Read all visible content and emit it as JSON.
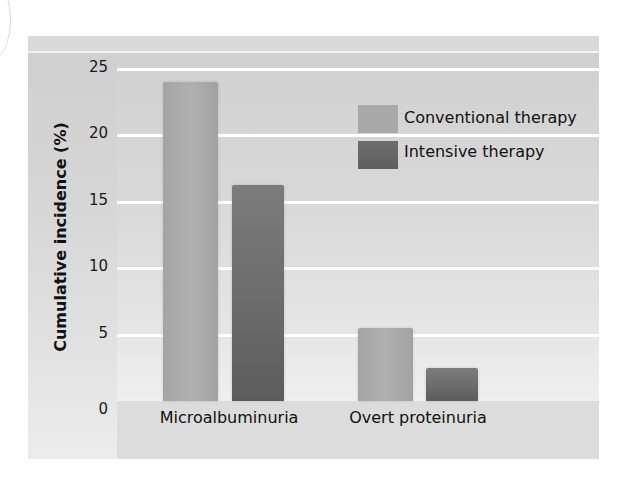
{
  "chart_data": {
    "type": "bar",
    "title": "",
    "xlabel": "",
    "ylabel": "Cumulative incidence (%)",
    "ylim": [
      0,
      25
    ],
    "yticks": [
      "0",
      "5",
      "10",
      "15",
      "20",
      "25"
    ],
    "grid": true,
    "legend_position": "upper right",
    "categories": [
      "Microalbuminuria",
      "Overt proteinuria"
    ],
    "series": [
      {
        "name": "Conventional therapy",
        "values": [
          24,
          5.5
        ],
        "color": "#a9a9a9"
      },
      {
        "name": "Intensive therapy",
        "values": [
          16.3,
          2.5
        ],
        "color": "#666666"
      }
    ]
  },
  "legend": {
    "items": [
      {
        "label": "Conventional therapy"
      },
      {
        "label": "Intensive therapy"
      }
    ]
  }
}
